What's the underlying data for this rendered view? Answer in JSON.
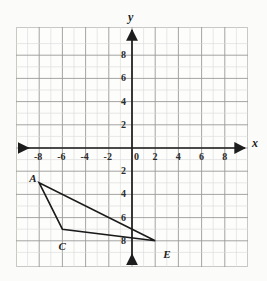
{
  "chart_data": {
    "type": "scatter",
    "title": "",
    "xlabel": "x",
    "ylabel": "y",
    "xlim": [
      -9.5,
      9.5
    ],
    "ylim": [
      -9.5,
      9.5
    ],
    "grid": true,
    "grid_step": 1,
    "major_step": 2,
    "legend": "none",
    "x_tick_labels": [
      "-8",
      "-6",
      "-4",
      "-2",
      "0",
      "2",
      "4",
      "6",
      "8"
    ],
    "x_tick_values": [
      -8,
      -6,
      -4,
      -2,
      0,
      2,
      4,
      6,
      8
    ],
    "y_tick_labels_positive": [
      "2",
      "4",
      "6",
      "8"
    ],
    "y_tick_values_positive": [
      2,
      4,
      6,
      8
    ],
    "y_tick_labels_negative": [
      "2",
      "4",
      "6",
      "8"
    ],
    "y_tick_values_negative": [
      -2,
      -4,
      -6,
      -8
    ],
    "origin_label": "0",
    "shapes": [
      {
        "name": "triangle-ACE",
        "type": "polygon",
        "closed": true,
        "vertices": [
          {
            "label": "A",
            "x": -8,
            "y": -3
          },
          {
            "label": "C",
            "x": -6,
            "y": -7
          },
          {
            "label": "E",
            "x": 2,
            "y": -8
          }
        ]
      }
    ],
    "annotations": [
      {
        "text": "A",
        "x": -8,
        "y": -3,
        "dx": -10,
        "dy": -10
      },
      {
        "text": "C",
        "x": -6,
        "y": -7,
        "dx": -4,
        "dy": 12
      },
      {
        "text": "E",
        "x": 2,
        "y": -8,
        "dx": 8,
        "dy": 8
      }
    ]
  },
  "axes": {
    "x_axis_name": "x",
    "y_axis_name": "y"
  },
  "colors": {
    "grid_minor": "#d8d8d6",
    "grid_major": "#9a9a98",
    "axis": "#1d1d1d",
    "shape_stroke": "#1a1a1a",
    "page_background": "#fbfbfa",
    "plot_background": "#fdfdfc"
  }
}
